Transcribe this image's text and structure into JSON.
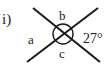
{
  "problem": {
    "part_label": "i)",
    "angle_labels": {
      "a": "a",
      "b": "b",
      "c": "c",
      "given": "27°"
    }
  },
  "diagram": {
    "type": "intersecting-lines",
    "lines": [
      {
        "x1": 33,
        "y1": 8,
        "x2": 100,
        "y2": 62
      },
      {
        "x1": 27,
        "y1": 62,
        "x2": 98,
        "y2": 8
      }
    ],
    "circle": {
      "cx": 63,
      "cy": 34,
      "r": 10
    },
    "stroke_color": "#1a1a1a"
  }
}
